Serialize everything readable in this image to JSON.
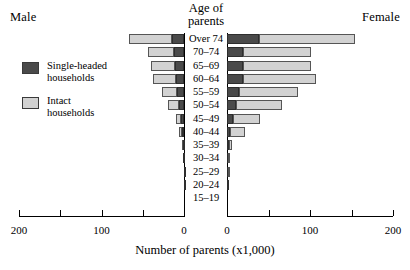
{
  "figure": {
    "male_label": "Male",
    "female_label": "Female",
    "category_axis_title_line1": "Age of",
    "category_axis_title_line2": "parents",
    "x_axis_caption": "Number of parents (x1,000)"
  },
  "legend": {
    "items": [
      {
        "key": "single",
        "label_line1": "Single-headed",
        "label_line2": "households",
        "color": "#4a4a4a"
      },
      {
        "key": "intact",
        "label_line1": "Intact",
        "label_line2": "households",
        "color": "#d2d2d2"
      }
    ]
  },
  "axis": {
    "left_ticks": [
      "200",
      "",
      "100",
      "",
      "0"
    ],
    "right_ticks": [
      "0",
      "",
      "100",
      "",
      "200"
    ],
    "tick_values": [
      200,
      150,
      100,
      50,
      0
    ],
    "max": 200,
    "minor_step": 50
  },
  "chart_data": {
    "type": "bar",
    "title": "Number of parents (x1,000)",
    "subtype": "population-pyramid",
    "orientation": "horizontal",
    "stacked": true,
    "xlabel": "Number of parents (x1,000)",
    "ylabel": "Age of parents",
    "xlim": [
      0,
      200
    ],
    "grid": false,
    "legend_position": "left",
    "categories": [
      "Over 74",
      "70–74",
      "65–69",
      "60–64",
      "55–59",
      "50–54",
      "45–49",
      "40–44",
      "35–39",
      "30–34",
      "25–29",
      "20–24",
      "15–19"
    ],
    "sides": [
      "Male",
      "Female"
    ],
    "series": [
      {
        "name": "Single-headed households",
        "color": "#4a4a4a",
        "male": [
          14,
          12,
          11,
          10,
          8,
          6,
          4,
          2.5,
          1.5,
          1,
          0.5,
          0.3,
          0.2
        ],
        "female": [
          39,
          19,
          19,
          19,
          15,
          11,
          7,
          4,
          2,
          1.5,
          0.8,
          0.4,
          0.2
        ]
      },
      {
        "name": "Intact households",
        "color": "#d2d2d2",
        "male": [
          53,
          32,
          29,
          28,
          19,
          13,
          6,
          3,
          1,
          0.5,
          0.3,
          0.2,
          0.1
        ],
        "female": [
          115,
          82,
          82,
          88,
          70,
          55,
          33,
          18,
          4,
          1.5,
          0.5,
          0.3,
          0.1
        ]
      }
    ],
    "totals": {
      "male": [
        67,
        44,
        40,
        38,
        27,
        19,
        10,
        5.5,
        2.5,
        1.5,
        0.8,
        0.5,
        0.3
      ],
      "female": [
        154,
        101,
        101,
        107,
        85,
        66,
        40,
        22,
        6,
        3,
        1.3,
        0.7,
        0.3
      ]
    }
  }
}
